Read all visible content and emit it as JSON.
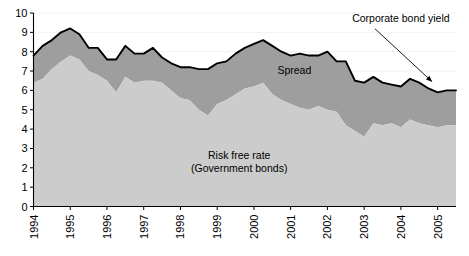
{
  "chart_data": {
    "type": "area",
    "title": "",
    "subtitle": "",
    "xlabel": "",
    "ylabel": "",
    "ylim": [
      0,
      10
    ],
    "yticks": [
      0,
      1,
      2,
      3,
      4,
      5,
      6,
      7,
      8,
      9,
      10
    ],
    "xlim": [
      1994.0,
      2005.5
    ],
    "xticks": [
      1994,
      1995,
      1996,
      1997,
      1998,
      1999,
      2000,
      2001,
      2002,
      2003,
      2004,
      2005
    ],
    "xtick_labels": [
      "1994",
      "1995",
      "1996",
      "1997",
      "1998",
      "1999",
      "2000",
      "2001",
      "2002",
      "2003",
      "2004",
      "2005"
    ],
    "xtick_rotation": 90,
    "grid": false,
    "stacked": true,
    "legend_position": "inline-annotations",
    "x": [
      1994.0,
      1994.25,
      1994.5,
      1994.75,
      1995.0,
      1995.25,
      1995.5,
      1995.75,
      1996.0,
      1996.25,
      1996.5,
      1996.75,
      1997.0,
      1997.25,
      1997.5,
      1997.75,
      1998.0,
      1998.25,
      1998.5,
      1998.75,
      1999.0,
      1999.25,
      1999.5,
      1999.75,
      2000.0,
      2000.25,
      2000.5,
      2000.75,
      2001.0,
      2001.25,
      2001.5,
      2001.75,
      2002.0,
      2002.25,
      2002.5,
      2002.75,
      2003.0,
      2003.25,
      2003.5,
      2003.75,
      2004.0,
      2004.25,
      2004.5,
      2004.75,
      2005.0,
      2005.25,
      2005.5
    ],
    "series": [
      {
        "name": "Risk free rate (Government bonds)",
        "color": "#cccccc",
        "values": [
          6.4,
          6.6,
          7.1,
          7.5,
          7.8,
          7.6,
          7.0,
          6.8,
          6.5,
          5.9,
          6.7,
          6.4,
          6.5,
          6.5,
          6.4,
          6.0,
          5.6,
          5.5,
          5.0,
          4.7,
          5.3,
          5.5,
          5.8,
          6.1,
          6.2,
          6.4,
          5.8,
          5.5,
          5.3,
          5.1,
          5.0,
          5.2,
          5.0,
          4.9,
          4.2,
          3.9,
          3.6,
          4.3,
          4.2,
          4.3,
          4.1,
          4.5,
          4.3,
          4.2,
          4.1,
          4.2,
          4.2
        ]
      },
      {
        "name": "Spread",
        "color": "#9e9e9e",
        "values": [
          1.4,
          1.7,
          1.5,
          1.5,
          1.4,
          1.3,
          1.2,
          1.4,
          1.1,
          1.7,
          1.6,
          1.5,
          1.4,
          1.7,
          1.3,
          1.4,
          1.6,
          1.7,
          2.1,
          2.4,
          2.1,
          2.0,
          2.1,
          2.1,
          2.2,
          2.2,
          2.5,
          2.5,
          2.5,
          2.8,
          2.8,
          2.6,
          3.0,
          2.6,
          3.3,
          2.6,
          2.8,
          2.4,
          2.2,
          2.0,
          2.1,
          2.1,
          2.1,
          1.9,
          1.8,
          1.8,
          1.8
        ]
      }
    ],
    "total_line": {
      "name": "Corporate bond yield",
      "color": "#000000",
      "values": [
        7.8,
        8.3,
        8.6,
        9.0,
        9.2,
        8.9,
        8.2,
        8.2,
        7.6,
        7.6,
        8.3,
        7.9,
        7.9,
        8.2,
        7.7,
        7.4,
        7.2,
        7.2,
        7.1,
        7.1,
        7.4,
        7.5,
        7.9,
        8.2,
        8.4,
        8.6,
        8.3,
        8.0,
        7.8,
        7.9,
        7.8,
        7.8,
        8.0,
        7.5,
        7.5,
        6.5,
        6.4,
        6.7,
        6.4,
        6.3,
        6.2,
        6.6,
        6.4,
        6.1,
        5.9,
        6.0,
        6.0
      ]
    },
    "annotations": [
      {
        "id": "spread-label",
        "text": "Spread",
        "x": 2001.1,
        "y": 6.85
      },
      {
        "id": "risk-free-label-line1",
        "text": "Risk free rate",
        "x": 1999.6,
        "y": 2.45
      },
      {
        "id": "risk-free-label-line2",
        "text": "(Government bonds)",
        "x": 1999.6,
        "y": 1.8
      },
      {
        "id": "corporate-bond-yield-callout",
        "text": "Corporate bond yield",
        "x": 2004.0,
        "y": 9.55,
        "arrow_to_x": 2004.85,
        "arrow_to_y": 6.45
      }
    ],
    "colors": {
      "risk_free_area": "#cccccc",
      "spread_area": "#9e9e9e",
      "yield_line": "#000000",
      "axis": "#000000",
      "background": "#ffffff",
      "text": "#000000"
    }
  }
}
